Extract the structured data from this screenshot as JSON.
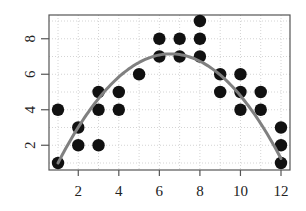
{
  "chart_data": {
    "type": "scatter",
    "title": "",
    "xlabel": "",
    "ylabel": "",
    "xlim": [
      0.6,
      12.4
    ],
    "ylim": [
      0.5,
      9.5
    ],
    "x_ticks": [
      2,
      4,
      6,
      8,
      10,
      12
    ],
    "y_ticks": [
      2,
      4,
      6,
      8
    ],
    "grid": true,
    "legend": null,
    "series": [
      {
        "name": "points",
        "type": "scatter",
        "color": "#111111",
        "points": [
          {
            "x": 1,
            "y": 1
          },
          {
            "x": 1,
            "y": 4
          },
          {
            "x": 2,
            "y": 2
          },
          {
            "x": 2,
            "y": 3
          },
          {
            "x": 3,
            "y": 2
          },
          {
            "x": 3,
            "y": 4
          },
          {
            "x": 3,
            "y": 5
          },
          {
            "x": 4,
            "y": 4
          },
          {
            "x": 4,
            "y": 5
          },
          {
            "x": 5,
            "y": 6
          },
          {
            "x": 6,
            "y": 7
          },
          {
            "x": 6,
            "y": 8
          },
          {
            "x": 7,
            "y": 7
          },
          {
            "x": 7,
            "y": 8
          },
          {
            "x": 8,
            "y": 7
          },
          {
            "x": 8,
            "y": 8
          },
          {
            "x": 8,
            "y": 9
          },
          {
            "x": 9,
            "y": 5
          },
          {
            "x": 9,
            "y": 6
          },
          {
            "x": 10,
            "y": 4
          },
          {
            "x": 10,
            "y": 5
          },
          {
            "x": 10,
            "y": 6
          },
          {
            "x": 11,
            "y": 4
          },
          {
            "x": 11,
            "y": 5
          },
          {
            "x": 12,
            "y": 1
          },
          {
            "x": 12,
            "y": 2
          },
          {
            "x": 12,
            "y": 3
          }
        ]
      },
      {
        "name": "quadratic fit",
        "type": "line",
        "color": "#808080",
        "coefficients": {
          "a": -0.199,
          "b": 2.61,
          "c": -1.41
        },
        "x_range": [
          1,
          12
        ]
      }
    ]
  },
  "layout": {
    "plot_box": {
      "left": 49,
      "top": 15,
      "right": 290,
      "bottom": 170
    },
    "x_px": {
      "v1": 58,
      "v12": 281
    },
    "y_px": {
      "v1": 163,
      "v9": 21
    },
    "colors": {
      "axis": "#555555",
      "grid": "#d4d4d4",
      "point": "#111111",
      "curve": "#808080"
    }
  }
}
